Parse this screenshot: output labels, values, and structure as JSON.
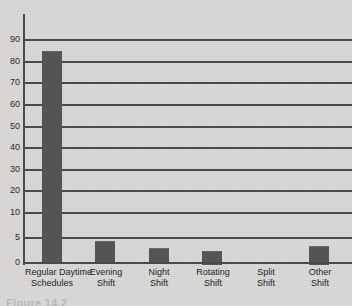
{
  "figure": {
    "caption": "Figure 14.2",
    "background_color": "#d9d8d6",
    "bar_color": "#545454",
    "axis_color": "#4a4a4a"
  },
  "chart_data": {
    "type": "bar",
    "title": "",
    "subtitle": "",
    "xlabel": "",
    "ylabel": "",
    "categories": [
      "Regular Daytime Schedules",
      "Evening Shift",
      "Night Shift",
      "Rotating Shift",
      "Split Shift",
      "Other Shift"
    ],
    "category_lines": [
      [
        "Regular Daytime",
        "Schedules"
      ],
      [
        "Evening",
        "Shift"
      ],
      [
        "Night",
        "Shift"
      ],
      [
        "Rotating",
        "Shift"
      ],
      [
        "Split",
        "Shift"
      ],
      [
        "Other",
        "Shift"
      ]
    ],
    "values": [
      85,
      4.4,
      3,
      2.5,
      0.2,
      3.5
    ],
    "ylim": [
      0,
      90
    ],
    "yticks": [
      0,
      5,
      10,
      20,
      30,
      40,
      50,
      60,
      70,
      80,
      90
    ],
    "ytick_labels": [
      "0",
      "5",
      "10",
      "20",
      "30",
      "40",
      "50",
      "60",
      "70",
      "80",
      "90"
    ],
    "y_axis_note": "non-uniform spacing: 0-5-10 larger steps than 10-90 decade steps",
    "grid": true,
    "grid_orientation": "horizontal",
    "legend": false,
    "legend_position": "none"
  }
}
